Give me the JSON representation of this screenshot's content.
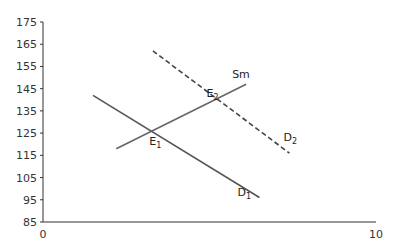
{
  "chart_data": {
    "type": "line",
    "title": "",
    "xlabel": "",
    "ylabel": "",
    "xlim": [
      0,
      10
    ],
    "ylim": [
      85,
      175
    ],
    "x_ticks": [
      "0",
      "10"
    ],
    "y_ticks": [
      "175",
      "165",
      "155",
      "145",
      "135",
      "125",
      "115",
      "105",
      "95",
      "85"
    ],
    "grid": false,
    "legend": "none",
    "series": [
      {
        "name": "D1",
        "label": "D",
        "sub": "1",
        "style": "solid",
        "color": "#555555",
        "points": [
          [
            1.5,
            142
          ],
          [
            6.5,
            96
          ]
        ]
      },
      {
        "name": "Sm",
        "label": "Sm",
        "sub": "",
        "style": "solid",
        "color": "#666666",
        "points": [
          [
            2.2,
            118
          ],
          [
            6.1,
            147
          ]
        ]
      },
      {
        "name": "D2",
        "label": "D",
        "sub": "2",
        "style": "dashed",
        "color": "#444444",
        "points": [
          [
            3.3,
            162
          ],
          [
            7.4,
            116
          ]
        ]
      }
    ],
    "annotations": [
      {
        "text": "E",
        "sub": "1",
        "x": 3.25,
        "y": 126
      },
      {
        "text": "E",
        "sub": "2",
        "x": 5.0,
        "y": 138.5
      }
    ]
  }
}
